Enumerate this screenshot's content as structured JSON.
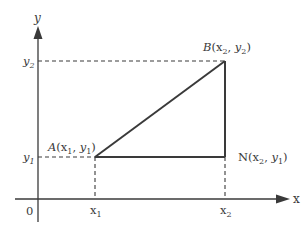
{
  "diagram": {
    "type": "coordinate-geometry",
    "colors": {
      "line": "#3a3a3a",
      "text": "#3a3a3a",
      "background": "#ffffff"
    },
    "axes": {
      "x_label": "x",
      "y_label": "y",
      "origin_label": "0"
    },
    "ticks": {
      "x1": {
        "base": "x",
        "sub": "1"
      },
      "x2": {
        "base": "x",
        "sub": "2"
      },
      "y1": {
        "base": "y",
        "sub": "1"
      },
      "y2": {
        "base": "y",
        "sub": "2"
      }
    },
    "points": {
      "A": {
        "name": "A",
        "open": "(",
        "xbase": "x",
        "xsub": "1",
        "sep": ", ",
        "ybase": "y",
        "ysub": "1",
        "close": ")"
      },
      "B": {
        "name": "B",
        "open": "(",
        "xbase": "x",
        "xsub": "2",
        "sep": ", ",
        "ybase": "y",
        "ysub": "2",
        "close": ")"
      },
      "N": {
        "name": "N",
        "open": "(",
        "xbase": "x",
        "xsub": "2",
        "sep": ", ",
        "ybase": "y",
        "ysub": "1",
        "close": ")"
      }
    },
    "segments": [
      "AB",
      "BN",
      "AN"
    ],
    "guides": [
      "y2-to-B",
      "y1-to-A",
      "A-to-x1",
      "N-to-x2"
    ]
  }
}
